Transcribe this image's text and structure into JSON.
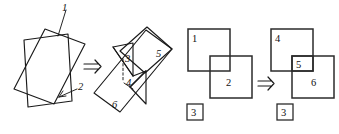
{
  "figure": {
    "background_color": "#ffffff",
    "line_color": "#1a1a1a",
    "square_color": "#2b2b2b",
    "width": 339,
    "height": 134
  },
  "panel_left": {
    "name": "two-intersecting-parallelograms",
    "labels": {
      "plane_1": "1",
      "plane_2": "2"
    }
  },
  "arrow_1": {
    "glyph": "double-right-arrow",
    "symbol": "⇒"
  },
  "panel_middle": {
    "name": "exploded-intersecting-planes",
    "labels": {
      "region_3": "3",
      "region_4": "4",
      "region_5": "5",
      "region_6": "6"
    }
  },
  "panel_schematic_before": {
    "name": "overlapping-squares-before",
    "labels": {
      "square_1": "1",
      "square_2": "2",
      "boxed_3": "3"
    }
  },
  "arrow_2": {
    "glyph": "double-right-arrow",
    "symbol": "⇒"
  },
  "panel_schematic_after": {
    "name": "overlapping-squares-after",
    "labels": {
      "square_4": "4",
      "square_5": "5",
      "square_6": "6",
      "boxed_3": "3"
    }
  }
}
